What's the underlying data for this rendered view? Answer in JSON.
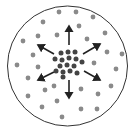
{
  "diagram": {
    "boundary": {
      "cx": 67.5,
      "cy": 66,
      "r": 60,
      "stroke": "#333333"
    },
    "colors": {
      "outer_dot": "#8a8a8a",
      "center_dot": "#444444",
      "arrow": "#222222"
    },
    "outer_dots": [
      [
        59,
        12
      ],
      [
        76,
        12
      ],
      [
        93,
        17
      ],
      [
        43,
        22
      ],
      [
        79,
        26
      ],
      [
        105,
        33
      ],
      [
        23,
        41
      ],
      [
        38,
        36
      ],
      [
        57,
        35
      ],
      [
        87,
        39
      ],
      [
        33,
        55
      ],
      [
        107,
        52
      ],
      [
        122,
        54
      ],
      [
        17,
        65
      ],
      [
        38,
        67
      ],
      [
        94,
        63
      ],
      [
        116,
        69
      ],
      [
        28,
        78
      ],
      [
        54,
        86
      ],
      [
        111,
        86
      ],
      [
        81,
        89
      ],
      [
        45,
        90
      ],
      [
        28,
        96
      ],
      [
        98,
        94
      ],
      [
        57,
        101
      ],
      [
        42,
        107
      ],
      [
        81,
        109
      ],
      [
        97,
        109
      ],
      [
        62,
        117
      ]
    ],
    "center_dots": [
      [
        61,
        53
      ],
      [
        68,
        52
      ],
      [
        75,
        52
      ],
      [
        55,
        59
      ],
      [
        62,
        60
      ],
      [
        69,
        58
      ],
      [
        76,
        59
      ],
      [
        82,
        62
      ],
      [
        60,
        66
      ],
      [
        67,
        65
      ],
      [
        74,
        66
      ],
      [
        56,
        71
      ],
      [
        63,
        72
      ],
      [
        70,
        71
      ],
      [
        77,
        73
      ],
      [
        63,
        77
      ]
    ],
    "arrows": [
      {
        "name": "arrow-up",
        "x1": 69,
        "y1": 45,
        "x2": 69,
        "y2": 26
      },
      {
        "name": "arrow-down",
        "x1": 69,
        "y1": 80,
        "x2": 69,
        "y2": 98
      },
      {
        "name": "arrow-upper-left",
        "x1": 54,
        "y1": 54,
        "x2": 38,
        "y2": 45
      },
      {
        "name": "arrow-upper-right",
        "x1": 83,
        "y1": 54,
        "x2": 100,
        "y2": 44
      },
      {
        "name": "arrow-lower-left",
        "x1": 54,
        "y1": 72,
        "x2": 38,
        "y2": 80
      },
      {
        "name": "arrow-lower-right",
        "x1": 84,
        "y1": 71,
        "x2": 100,
        "y2": 80
      }
    ]
  }
}
